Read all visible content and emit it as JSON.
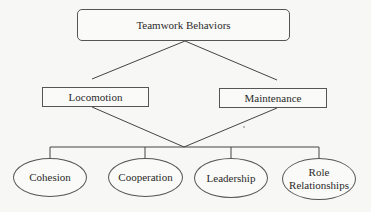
{
  "diagram": {
    "type": "hierarchy",
    "root": {
      "label": "Teamwork Behaviors"
    },
    "level2": [
      {
        "label": "Locomotion"
      },
      {
        "label": "Maintenance"
      }
    ],
    "level3": [
      {
        "label": "Cohesion"
      },
      {
        "label": "Cooperation"
      },
      {
        "label": "Leadership"
      },
      {
        "label_line1": "Role",
        "label_line2": "Relationships"
      }
    ],
    "colors": {
      "background": "#f7f7f5",
      "stroke": "#444444",
      "text": "#2a2a2a"
    }
  }
}
